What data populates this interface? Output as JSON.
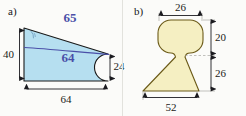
{
  "figure": {
    "background_color": "#fbfbf9"
  },
  "panels": [
    {
      "id": "a",
      "label": "a)",
      "shape_name": "triangle-with-semicircular-notch",
      "fill_color": "#b6dff0",
      "stroke_color": "#1a1a1a",
      "dimensions": [
        {
          "name": "left-height",
          "value": "40",
          "orientation": "vertical",
          "position": "left"
        },
        {
          "name": "bottom-width",
          "value": "64",
          "orientation": "horizontal",
          "position": "bottom"
        },
        {
          "name": "right-notch-diameter",
          "value": "24",
          "orientation": "vertical",
          "position": "right"
        }
      ],
      "handwriting": [
        {
          "name": "hypotenuse-annotation",
          "value": "65",
          "ink_color": "#4a4fa8"
        },
        {
          "name": "interior-line-annotation",
          "value": "64",
          "ink_color": "#4a4fa8"
        }
      ],
      "marks": [
        {
          "name": "angle-arc",
          "description": "faint blue angle arc at the left apex"
        },
        {
          "name": "hand-drawn-chord",
          "description": "blue freehand line from left vertex to right apex"
        }
      ]
    },
    {
      "id": "b",
      "label": "b)",
      "shape_name": "pawn-silhouette-rounded-top-over-trapezoid",
      "fill_color": "#f5efc2",
      "stroke_color": "#6b5a18",
      "dimensions": [
        {
          "name": "top-width",
          "value": "26",
          "orientation": "horizontal",
          "position": "top"
        },
        {
          "name": "upper-height",
          "value": "20",
          "orientation": "vertical",
          "position": "right-upper"
        },
        {
          "name": "lower-height",
          "value": "26",
          "orientation": "vertical",
          "position": "right-lower"
        },
        {
          "name": "bottom-width",
          "value": "52",
          "orientation": "horizontal",
          "position": "bottom"
        }
      ]
    }
  ]
}
